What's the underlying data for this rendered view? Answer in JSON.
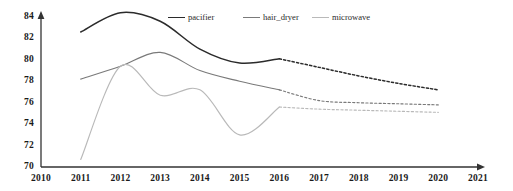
{
  "chart_data": {
    "type": "line",
    "title": "",
    "xlabel": "",
    "ylabel": "",
    "xlim": [
      2010,
      2021
    ],
    "ylim": [
      70,
      84
    ],
    "grid": false,
    "legend_position": "top-center",
    "x_ticks": [
      "2010",
      "2011",
      "2012",
      "2013",
      "2014",
      "2015",
      "2016",
      "2017",
      "2018",
      "2019",
      "2020",
      "2021"
    ],
    "y_ticks": [
      "70",
      "72",
      "74",
      "76",
      "78",
      "80",
      "82",
      "84"
    ],
    "x": [
      2011,
      2012,
      2013,
      2014,
      2015,
      2016,
      2017,
      2018,
      2019,
      2020
    ],
    "solid_until": 2016,
    "series": [
      {
        "name": "pacifier",
        "color": "#2b2b2b",
        "values": [
          82.6,
          84.4,
          83.6,
          81.0,
          79.7,
          80.1,
          79.3,
          78.5,
          77.8,
          77.2
        ]
      },
      {
        "name": "hair_dryer",
        "color": "#7a7a7a",
        "values": [
          78.2,
          79.4,
          80.7,
          79.0,
          78.0,
          77.2,
          76.2,
          76.0,
          75.9,
          75.8
        ]
      },
      {
        "name": "microwave",
        "color": "#b9b9b9",
        "values": [
          70.7,
          79.4,
          76.7,
          77.2,
          73.0,
          75.6,
          75.4,
          75.3,
          75.2,
          75.1
        ]
      }
    ]
  },
  "axes": {
    "x_axis_name": "x-axis",
    "y_axis_name": "y-axis"
  }
}
